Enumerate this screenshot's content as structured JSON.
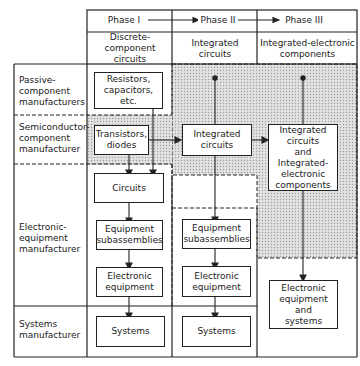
{
  "diagram": {
    "title": "",
    "phases": [
      {
        "label": "Phase I",
        "subtitle": "Discrete-component circuits"
      },
      {
        "label": "Phase II",
        "subtitle": "Integrated circuits"
      },
      {
        "label": "Phase III",
        "subtitle": "Integrated-electronic components"
      }
    ],
    "rows": [
      {
        "label": "Passive-\ncomponent\nmanufacturers"
      },
      {
        "label": "Semiconductor-\ncomponent\nmanufacturer"
      },
      {
        "label": "Electronic-\nequipment\nmanufacturer"
      },
      {
        "label": "Systems\nmanufacturer"
      }
    ],
    "boxes": {
      "resistors": "Resistors,\ncapacitors,\netc.",
      "transistors": "Transistors,\ndiodes",
      "circuits": "Circuits",
      "subassemblies_1": "Equipment\nsubassemblies",
      "equipment_1": "Electronic\nequipment",
      "systems_1": "Systems",
      "ic_2": "Integrated\ncircuits",
      "subassemblies_2": "Equipment\nsubassemblies",
      "equipment_2": "Electronic\nequipment",
      "systems_2": "Systems",
      "ic_3": "Integrated\ncircuits\nand\nIntegrated-\nelectronic\ncomponents",
      "equipment_systems_3": "Electronic\nequipment\nand\nsystems"
    },
    "colors": {
      "line": "#222222",
      "shade": "#d9d9d9",
      "background": "#ffffff"
    }
  }
}
